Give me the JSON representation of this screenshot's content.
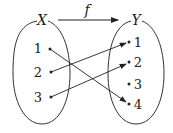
{
  "diagram": {
    "domain_label": "X",
    "codomain_label": "Y",
    "function_label": "f",
    "domain_elements": [
      "1",
      "2",
      "3"
    ],
    "codomain_elements": [
      "1",
      "2",
      "3",
      "4"
    ],
    "mapping": [
      {
        "from": "1",
        "to": "4"
      },
      {
        "from": "2",
        "to": "1"
      },
      {
        "from": "3",
        "to": "2"
      }
    ]
  }
}
